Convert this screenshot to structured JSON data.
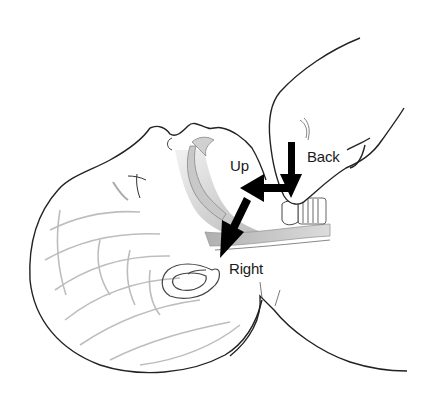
{
  "figure": {
    "colors": {
      "background": "#ffffff",
      "outline": "#222222",
      "soft_line": "#b5b5b5",
      "airway_shade": "#c9c9c9",
      "arrow": "#000000"
    },
    "labels": {
      "back": "Back",
      "up": "Up",
      "right": "Right"
    },
    "arrows": [
      {
        "name": "back",
        "direction": "down"
      },
      {
        "name": "up",
        "direction": "left"
      },
      {
        "name": "right",
        "direction": "down-left"
      }
    ]
  }
}
